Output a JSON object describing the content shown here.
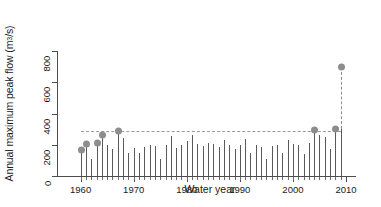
{
  "chart_data": {
    "type": "bar",
    "title": "",
    "xlabel": "Water year",
    "ylabel": "Annual maximum peak flow (m³/s)",
    "ylabel_text": "Annual maximum peak flow (m",
    "ylabel_sup": "3",
    "ylabel_tail": "/s)",
    "xlim": [
      1958,
      2010
    ],
    "ylim": [
      0,
      800
    ],
    "xticks": [
      1960,
      1970,
      1980,
      1990,
      2000,
      2010
    ],
    "yticks": [
      0,
      200,
      400,
      600,
      800
    ],
    "grid": false,
    "legend": false,
    "series_name": "Annual maximum peak flow",
    "record_line_value": 290,
    "record_line_start_year": 1960,
    "record_line_end_year": 2009,
    "categories": [
      1960,
      1961,
      1962,
      1963,
      1964,
      1965,
      1966,
      1967,
      1968,
      1969,
      1970,
      1971,
      1972,
      1973,
      1974,
      1975,
      1976,
      1977,
      1978,
      1979,
      1980,
      1981,
      1982,
      1983,
      1984,
      1985,
      1986,
      1987,
      1988,
      1989,
      1990,
      1991,
      1992,
      1993,
      1994,
      1995,
      1996,
      1997,
      1998,
      1999,
      2000,
      2001,
      2002,
      2003,
      2004,
      2005,
      2006,
      2007,
      2008,
      2009
    ],
    "values": [
      168,
      205,
      112,
      212,
      262,
      198,
      175,
      288,
      242,
      150,
      182,
      148,
      185,
      198,
      192,
      110,
      200,
      258,
      178,
      200,
      222,
      262,
      205,
      190,
      210,
      202,
      185,
      228,
      200,
      172,
      196,
      238,
      148,
      200,
      184,
      112,
      190,
      200,
      146,
      230,
      206,
      200,
      140,
      212,
      292,
      262,
      252,
      172,
      300,
      700
    ],
    "record_years": [
      1960,
      1961,
      1963,
      1964,
      1967,
      2004,
      2008,
      2009
    ],
    "record_values": [
      168,
      205,
      212,
      262,
      288,
      292,
      300,
      700
    ],
    "dashed_marker_year": 2009,
    "dashed_marker_value": 700,
    "colors": {
      "bar": "#5a5a5a",
      "marker": "#8d8d8d",
      "dashed_line": "#9a9a9a",
      "axis": "#4d4d4d",
      "background": "#ffffff"
    }
  }
}
